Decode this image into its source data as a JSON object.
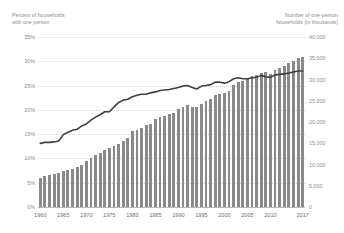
{
  "chart_data": {
    "type": "bar",
    "title": "",
    "xlabel": "",
    "left_axis": {
      "label": "Percent of households\nwith one person",
      "ticks": [
        "0%",
        "5%",
        "10%",
        "15%",
        "20%",
        "25%",
        "30%",
        "35%"
      ],
      "ylim": [
        0,
        35
      ],
      "unit": "percent"
    },
    "right_axis": {
      "label": "Number of one-person\nhouseholds (in thousands)",
      "ticks": [
        "0",
        "5,000",
        "10,000",
        "15,000",
        "20,000",
        "25,000",
        "30,000",
        "35,000",
        "40,000"
      ],
      "ylim": [
        0,
        40000
      ],
      "unit": "thousands"
    },
    "x_tick_labels": [
      "1960",
      "1965",
      "1970",
      "1975",
      "1980",
      "1985",
      "1990",
      "1995",
      "2000",
      "2005",
      "2010",
      "2017"
    ],
    "x": [
      1960,
      1961,
      1962,
      1963,
      1964,
      1965,
      1966,
      1967,
      1968,
      1969,
      1970,
      1971,
      1972,
      1973,
      1974,
      1975,
      1976,
      1977,
      1978,
      1979,
      1980,
      1981,
      1982,
      1983,
      1984,
      1985,
      1986,
      1987,
      1988,
      1989,
      1990,
      1991,
      1992,
      1993,
      1994,
      1995,
      1996,
      1997,
      1998,
      1999,
      2000,
      2001,
      2002,
      2003,
      2004,
      2005,
      2006,
      2007,
      2008,
      2009,
      2010,
      2011,
      2012,
      2013,
      2014,
      2015,
      2016,
      2017
    ],
    "grid": true,
    "legend_position": "none",
    "series": [
      {
        "name": "Number of one-person households (in thousands)",
        "type": "bar",
        "axis": "right",
        "color": "#8a8a8a",
        "values": [
          6917,
          7200,
          7500,
          7800,
          8100,
          8400,
          8700,
          9000,
          9400,
          10000,
          10851,
          11446,
          12189,
          12717,
          13366,
          13939,
          14458,
          14914,
          15532,
          16180,
          17816,
          18202,
          18659,
          19217,
          19517,
          20602,
          21191,
          21531,
          21889,
          22204,
          22999,
          23642,
          23974,
          23642,
          23611,
          24197,
          24900,
          25402,
          26327,
          26606,
          26724,
          27207,
          28755,
          29431,
          29742,
          30176,
          30779,
          31119,
          31437,
          31693,
          31376,
          32280,
          32745,
          33226,
          33879,
          34420,
          35093,
          35339
        ]
      },
      {
        "name": "Percent of households with one person",
        "type": "line",
        "axis": "left",
        "color": "#3f3f3f",
        "values": [
          13.1,
          13.3,
          13.3,
          13.4,
          13.6,
          14.9,
          15.4,
          15.8,
          16.0,
          16.7,
          17.1,
          17.9,
          18.5,
          19.0,
          19.6,
          19.6,
          20.6,
          21.5,
          22.0,
          22.2,
          22.7,
          23.0,
          23.2,
          23.2,
          23.5,
          23.7,
          24.0,
          24.1,
          24.2,
          24.4,
          24.6,
          24.9,
          25.0,
          24.6,
          24.3,
          24.9,
          25.0,
          25.2,
          25.7,
          25.7,
          25.5,
          25.8,
          26.4,
          26.6,
          26.4,
          26.4,
          26.6,
          26.7,
          27.1,
          26.8,
          26.7,
          27.2,
          27.3,
          27.4,
          27.6,
          27.8,
          28.0,
          28.0
        ]
      }
    ]
  }
}
